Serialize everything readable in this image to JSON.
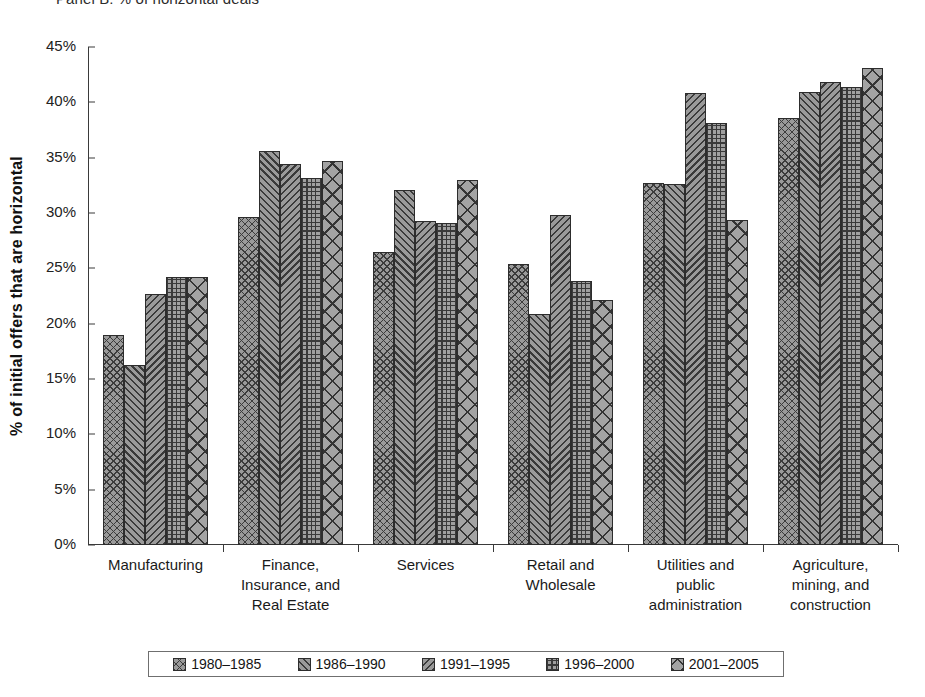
{
  "panel": {
    "title": "Panel B: % of horizontal deals"
  },
  "axes": {
    "y_title": "% of initial offers that are horizontal",
    "y_ticks": [
      "45%",
      "40%",
      "35%",
      "30%",
      "25%",
      "20%",
      "15%",
      "10%",
      "5%",
      "0%"
    ]
  },
  "legend": {
    "items": [
      {
        "label": "1980–1985",
        "pattern": "cross-hatch-fine",
        "swatch_class": "p0"
      },
      {
        "label": "1986–1990",
        "pattern": "diagonal-forward",
        "swatch_class": "p1"
      },
      {
        "label": "1991–1995",
        "pattern": "diagonal-backward",
        "swatch_class": "p2"
      },
      {
        "label": "1996–2000",
        "pattern": "grid-fine",
        "swatch_class": "p3"
      },
      {
        "label": "2001–2005",
        "pattern": "cross-hatch-large",
        "swatch_class": "p4"
      }
    ]
  },
  "chart_data": {
    "type": "bar",
    "title": "Panel B: % of horizontal deals",
    "xlabel": "",
    "ylabel": "% of initial offers that are horizontal",
    "ylim": [
      0,
      45
    ],
    "ytick_step": 5,
    "grid": false,
    "legend_position": "bottom",
    "value_unit": "percent",
    "categories": [
      "Manufacturing",
      "Finance,\nInsurance, and\nReal Estate",
      "Services",
      "Retail and\nWholesale",
      "Utilities and\npublic\nadministration",
      "Agriculture,\nmining, and\nconstruction"
    ],
    "series": [
      {
        "name": "1980–1985",
        "values": [
          19.0,
          29.6,
          26.5,
          25.4,
          32.7,
          38.6
        ]
      },
      {
        "name": "1986–1990",
        "values": [
          16.3,
          35.6,
          32.1,
          20.9,
          32.6,
          40.9
        ]
      },
      {
        "name": "1991–1995",
        "values": [
          22.7,
          34.4,
          29.3,
          29.8,
          40.8,
          41.8
        ]
      },
      {
        "name": "1996–2000",
        "values": [
          24.2,
          33.2,
          29.1,
          23.9,
          38.1,
          41.4
        ]
      },
      {
        "name": "2001–2005",
        "values": [
          24.2,
          34.7,
          33.0,
          22.1,
          29.4,
          43.1
        ]
      }
    ]
  }
}
